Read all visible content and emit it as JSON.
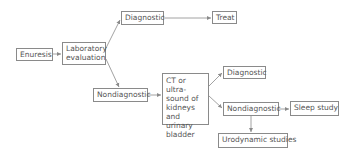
{
  "diagram": {
    "type": "flowchart",
    "nodes": {
      "enuresis": "Enuresis",
      "lab_eval_line1": "Laboratory",
      "lab_eval_line2": "evaluation",
      "diag_top": "Diagnostic",
      "treat": "Treat",
      "nondiag_left": "Nondiagnostic",
      "ct_line1": "CT or ultra-",
      "ct_line2": "sound of",
      "ct_line3": "kidneys",
      "ct_line4": "and urinary",
      "ct_line5": "bladder",
      "diag_right": "Diagnostic",
      "nondiag_right": "Nondiagnostic",
      "sleep": "Sleep study",
      "urodynamic": "Urodynamic studies"
    },
    "edges": [
      [
        "Enuresis",
        "Laboratory evaluation"
      ],
      [
        "Laboratory evaluation",
        "Diagnostic"
      ],
      [
        "Laboratory evaluation",
        "Nondiagnostic"
      ],
      [
        "Diagnostic",
        "Treat"
      ],
      [
        "Nondiagnostic",
        "CT or ultrasound of kidneys and urinary bladder"
      ],
      [
        "CT or ultrasound of kidneys and urinary bladder",
        "Diagnostic"
      ],
      [
        "CT or ultrasound of kidneys and urinary bladder",
        "Nondiagnostic"
      ],
      [
        "Nondiagnostic",
        "Sleep study"
      ],
      [
        "Nondiagnostic",
        "Urodynamic studies"
      ]
    ],
    "colors": {
      "line": "#8a8a8a",
      "text": "#555555"
    }
  }
}
